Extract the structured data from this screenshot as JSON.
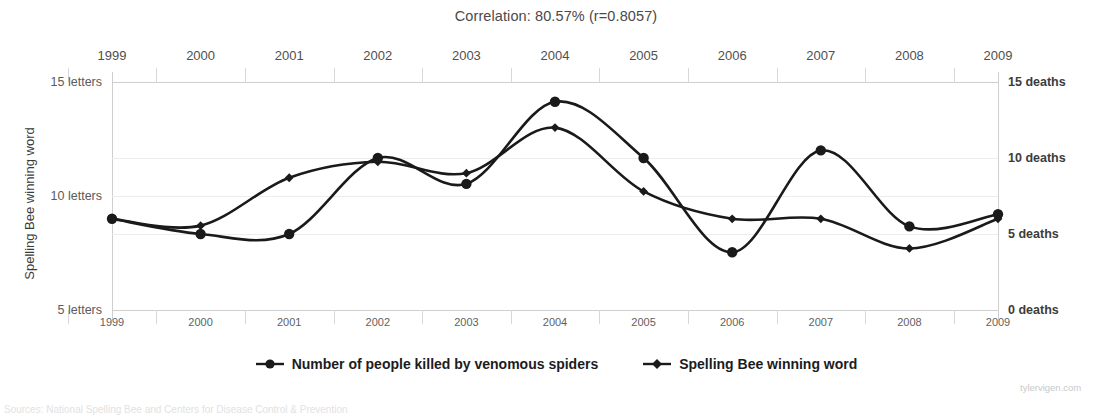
{
  "chart_data": {
    "type": "line",
    "title": "Correlation: 80.57% (r=0.8057)",
    "x": [
      1999,
      2000,
      2001,
      2002,
      2003,
      2004,
      2005,
      2006,
      2007,
      2008,
      2009
    ],
    "categories": [
      "1999",
      "2000",
      "2001",
      "2002",
      "2003",
      "2004",
      "2005",
      "2006",
      "2007",
      "2008",
      "2009"
    ],
    "series": [
      {
        "name": "Number of people killed by venomous spiders",
        "axis": "right",
        "unit": "deaths",
        "marker": "circle",
        "values": [
          6.0,
          5.0,
          5.0,
          10.0,
          8.3,
          13.7,
          10.0,
          3.8,
          10.5,
          5.5,
          6.3
        ]
      },
      {
        "name": "Spelling Bee winning word",
        "axis": "left",
        "unit": "letters",
        "marker": "diamond",
        "values": [
          9.0,
          8.7,
          10.8,
          11.5,
          11.0,
          13.0,
          10.2,
          9.0,
          9.0,
          7.7,
          9.0
        ]
      }
    ],
    "xlabel": "",
    "ylabel_left": "Spelling Bee winning word",
    "ylabel_right": "Number of people killed by venomous spiders",
    "ylim_left": [
      5,
      15
    ],
    "ylim_right": [
      0,
      15
    ],
    "yticks_left": [
      {
        "value": 15,
        "label": "15 letters"
      },
      {
        "value": 10,
        "label": "10 letters"
      },
      {
        "value": 5,
        "label": "5 letters"
      }
    ],
    "yticks_right": [
      {
        "value": 15,
        "label": "15 deaths"
      },
      {
        "value": 10,
        "label": "10 deaths"
      },
      {
        "value": 5,
        "label": "5 deaths"
      },
      {
        "value": 0,
        "label": "0 deaths"
      }
    ],
    "grid": true,
    "legend_position": "bottom",
    "line_color": "#1a1a1a",
    "grid_color": "#ededed"
  },
  "legend": {
    "items": [
      {
        "label": "Number of people killed by venomous spiders",
        "marker": "circle"
      },
      {
        "label": "Spelling Bee winning word",
        "marker": "diamond"
      }
    ]
  },
  "watermark": "tylervigen.com",
  "source_note": "Sources: National Spelling Bee and Centers for Disease Control & Prevention"
}
